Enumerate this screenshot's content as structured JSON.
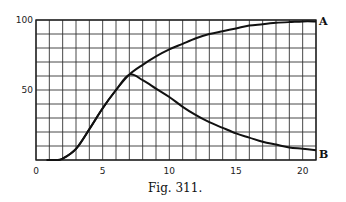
{
  "figure": {
    "caption": "Fig. 311."
  },
  "chart_data": {
    "type": "line",
    "title": "",
    "caption": "Fig. 311.",
    "xlabel": "",
    "ylabel": "",
    "xlim": [
      0,
      21
    ],
    "ylim": [
      0,
      100
    ],
    "xticks": [
      0,
      5,
      10,
      15,
      20
    ],
    "xtick_labels": [
      "0",
      "5",
      "10",
      "15",
      "20"
    ],
    "yticks": [
      50,
      100
    ],
    "ytick_labels": [
      "50",
      "100"
    ],
    "grid": true,
    "grid_x_step": 1,
    "grid_y_step": 10,
    "legend": "none",
    "series": [
      {
        "name": "A",
        "end_label": "A",
        "x": [
          1.5,
          2,
          3,
          4,
          5,
          6,
          7,
          8,
          9,
          10,
          11,
          12,
          13,
          14,
          15,
          16,
          17,
          18,
          19,
          20,
          21
        ],
        "values": [
          0,
          1,
          8,
          22,
          37,
          50,
          61,
          68,
          74,
          79,
          83,
          87,
          90,
          92,
          94,
          96,
          97,
          98,
          98.5,
          99,
          99
        ]
      },
      {
        "name": "B",
        "end_label": "B",
        "x": [
          1.5,
          2,
          3,
          4,
          5,
          6,
          7,
          8,
          9,
          10,
          11,
          12,
          13,
          14,
          15,
          16,
          17,
          18,
          19,
          20,
          21
        ],
        "values": [
          0,
          1,
          8,
          22,
          37,
          50,
          61,
          57,
          51,
          45,
          38,
          32,
          27,
          23,
          19,
          16,
          13,
          11,
          9,
          8,
          7
        ]
      }
    ]
  }
}
